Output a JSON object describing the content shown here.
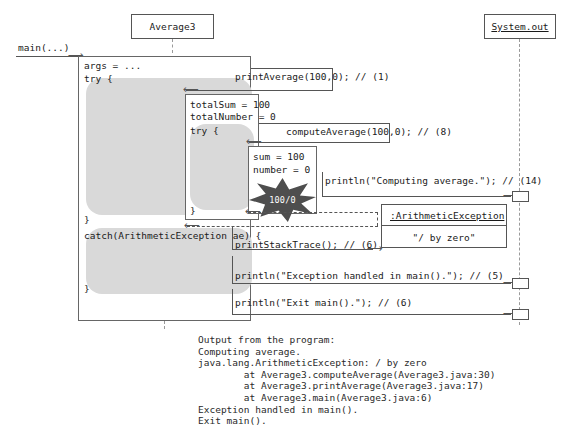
{
  "diagram": {
    "type": "uml-sequence-diagram",
    "entry_message": "main(...)"
  },
  "participants": [
    {
      "name": "Average3",
      "label": "Average3",
      "underlined": false
    },
    {
      "name": "System.out",
      "label": "System.out",
      "underlined": true
    }
  ],
  "frames": {
    "main": {
      "lines": [
        "args = ...",
        "try {",
        "}",
        "catch(ArithmeticException ae) {",
        "}"
      ],
      "args": "args = ...",
      "try_open": "try {",
      "try_close": "}",
      "catch_open": "catch(ArithmeticException ae) {",
      "catch_close": "}"
    },
    "print_average": {
      "var1": "totalSum = 100",
      "var2": "totalNumber = 0",
      "try_open": "try {",
      "try_close": "}"
    },
    "compute_average": {
      "var1": "sum = 100",
      "var2": "number = 0"
    }
  },
  "messages": [
    {
      "name": "print-average-call",
      "text": "printAverage(100,0); // (1)"
    },
    {
      "name": "compute-average-call",
      "text": "computeAverage(100,0); // (8)"
    },
    {
      "name": "println-computing",
      "text": "println(\"Computing average.\"); // (14)"
    },
    {
      "name": "print-stack-trace",
      "text": "printStackTrace(); // (6)"
    },
    {
      "name": "println-handled",
      "text": "println(\"Exception handled in main().\"); // (5)"
    },
    {
      "name": "println-exit",
      "text": "println(\"Exit main().\"); // (6)"
    }
  ],
  "exception": {
    "star_label": "100/0",
    "object_name": ":ArithmeticException",
    "object_value": "\"/ by zero\""
  },
  "output": {
    "heading": "Output from the program:",
    "lines": [
      "Output from the program:",
      "Computing average.",
      "java.lang.ArithmeticException: / by zero",
      "        at Average3.computeAverage(Average3.java:30)",
      "        at Average3.printAverage(Average3.java:17)",
      "        at Average3.main(Average3.java:6)",
      "Exception handled in main().",
      "Exit main()."
    ],
    "text": "Output from the program:\nComputing average.\njava.lang.ArithmeticException: / by zero\n        at Average3.computeAverage(Average3.java:30)\n        at Average3.printAverage(Average3.java:17)\n        at Average3.main(Average3.java:6)\nException handled in main().\nExit main()."
  },
  "colors": {
    "block_fill": "#d9d9d9",
    "star_fill": "#4e4e4e",
    "line": "#555555",
    "background": "#ffffff"
  }
}
